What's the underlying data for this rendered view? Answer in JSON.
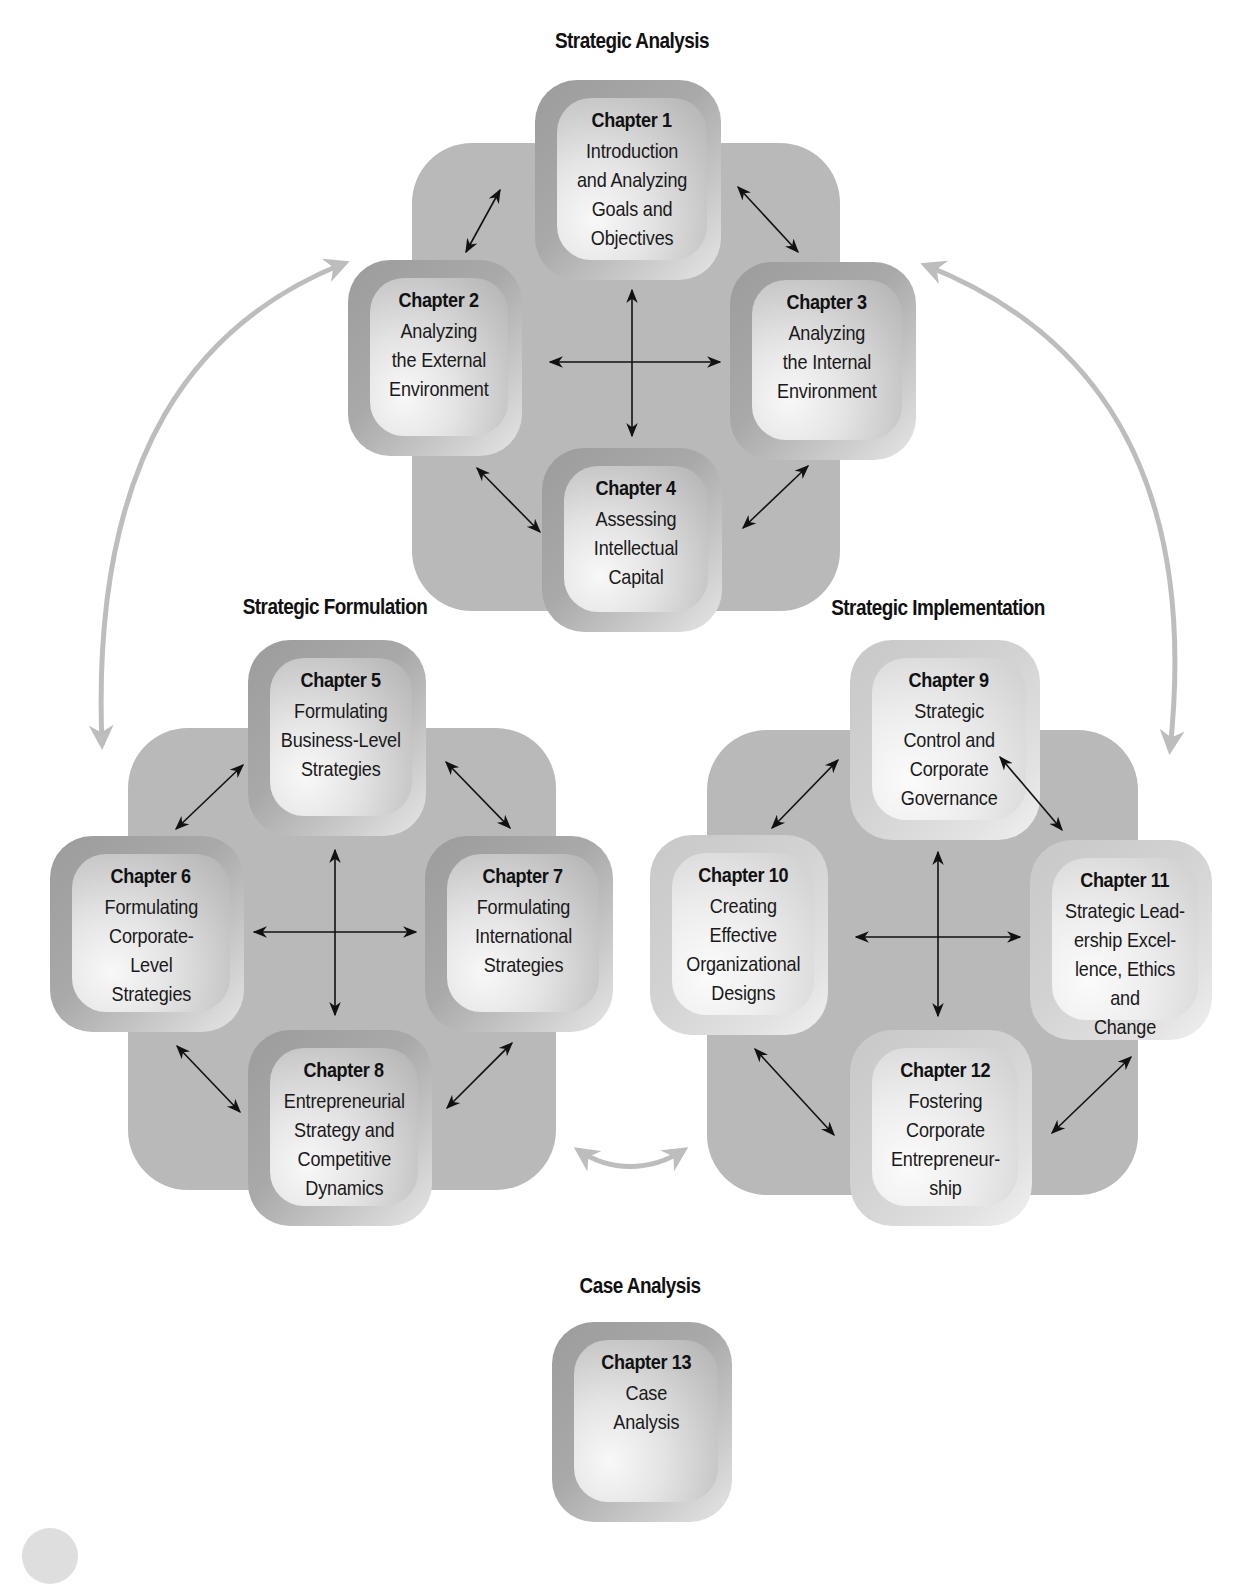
{
  "sections": {
    "analysis": {
      "title": "Strategic Analysis"
    },
    "formulation": {
      "title": "Strategic Formulation"
    },
    "implementation": {
      "title": "Strategic Implementation"
    },
    "case": {
      "title": "Case Analysis"
    }
  },
  "chapters": [
    {
      "label": "Chapter 1",
      "desc": "Introduction\nand Analyzing\nGoals and\nObjectives"
    },
    {
      "label": "Chapter 2",
      "desc": "Analyzing\nthe External\nEnvironment"
    },
    {
      "label": "Chapter 3",
      "desc": "Analyzing\nthe Internal\nEnvironment"
    },
    {
      "label": "Chapter 4",
      "desc": "Assessing\nIntellectual\nCapital"
    },
    {
      "label": "Chapter 5",
      "desc": "Formulating\nBusiness-Level\nStrategies"
    },
    {
      "label": "Chapter 6",
      "desc": "Formulating\nCorporate-\nLevel\nStrategies"
    },
    {
      "label": "Chapter 7",
      "desc": "Formulating\nInternational\nStrategies"
    },
    {
      "label": "Chapter 8",
      "desc": "Entrepreneurial\nStrategy and\nCompetitive\nDynamics"
    },
    {
      "label": "Chapter 9",
      "desc": "Strategic\nControl and\nCorporate\nGovernance"
    },
    {
      "label": "Chapter 10",
      "desc": "Creating\nEffective\nOrganizational\nDesigns"
    },
    {
      "label": "Chapter 11",
      "desc": "Strategic Lead-\nership Excel-\nlence, Ethics and\nChange"
    },
    {
      "label": "Chapter 12",
      "desc": "Fostering\nCorporate\nEntrepreneur-\nship"
    },
    {
      "label": "Chapter 13",
      "desc": "Case\nAnalysis"
    }
  ],
  "colors": {
    "plate": "#b9b9b9",
    "frame_dark": "#a9a9a9",
    "frame_light": "#d2d2d2",
    "connector_arrow": "#111111",
    "cycle_arrow": "#bdbdbd"
  }
}
